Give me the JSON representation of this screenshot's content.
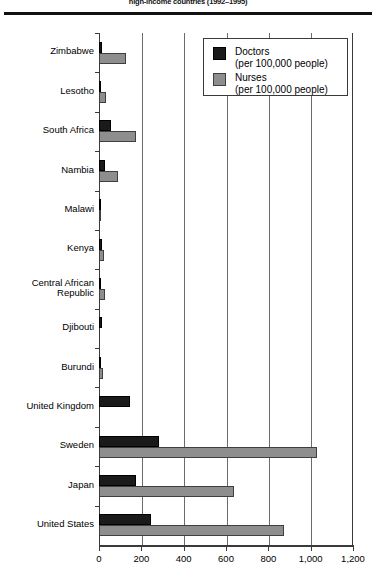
{
  "title": "high-income countries (1992–1995)",
  "legend": {
    "position": "top-right",
    "entries": [
      {
        "name": "Doctors",
        "sub": "(per 100,000 people)",
        "swatch": "doctors",
        "color": "#1a1a1a"
      },
      {
        "name": "Nurses",
        "sub": "(per 100,000 people)",
        "swatch": "nurses",
        "color": "#8e8e8e"
      }
    ]
  },
  "axis": {
    "ticks": [
      "0",
      "200",
      "400",
      "600",
      "800",
      "1,000",
      "1,200"
    ],
    "tick_values": [
      0,
      200,
      400,
      600,
      800,
      1000,
      1200
    ]
  },
  "chart_data": {
    "type": "bar",
    "orientation": "horizontal",
    "title": "high-income countries (1992–1995)",
    "xlabel": "",
    "ylabel": "",
    "xlim": [
      0,
      1200
    ],
    "grid": true,
    "legend_position": "top-right",
    "categories": [
      "Zimbabwe",
      "Lesotho",
      "South Africa",
      "Nambia",
      "Malawi",
      "Kenya",
      "Central African\nRepublic",
      "Djibouti",
      "Burundi",
      "United Kingdom",
      "Sweden",
      "Japan",
      "United States"
    ],
    "series": [
      {
        "name": "Doctors",
        "unit": "per 100,000 people",
        "color": "#1a1a1a",
        "values": [
          14,
          5,
          59,
          30,
          2,
          15,
          4,
          13,
          6,
          146,
          283,
          177,
          245
        ]
      },
      {
        "name": "Nurses",
        "unit": "per 100,000 people",
        "color": "#8e8e8e",
        "values": [
          128,
          33,
          175,
          88,
          2,
          23,
          29,
          0,
          17,
          0,
          1030,
          640,
          875
        ]
      }
    ]
  }
}
